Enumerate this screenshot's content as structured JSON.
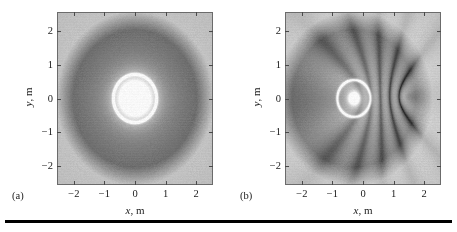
{
  "figure": {
    "background": "#ffffff",
    "rule_color": "#000000"
  },
  "panels": [
    {
      "caption": "(a)",
      "axis": {
        "xlabel_symbol": "x",
        "xlabel_unit": ", m",
        "ylabel_symbol": "y",
        "ylabel_unit": ", m",
        "xticks": [
          "-2",
          "-1",
          "0",
          "1",
          "2"
        ],
        "xtick_values": [
          -2,
          -1,
          0,
          1,
          2
        ],
        "yticks": [
          "2",
          "1",
          "0",
          "-1",
          "-2"
        ],
        "ytick_values": [
          2,
          1,
          0,
          -1,
          -2
        ],
        "xlim": [
          -2.55,
          2.55
        ],
        "ylim": [
          -2.55,
          2.55
        ]
      }
    },
    {
      "caption": "(b)",
      "axis": {
        "xlabel_symbol": "x",
        "xlabel_unit": ", m",
        "ylabel_symbol": "y",
        "ylabel_unit": ", m",
        "xticks": [
          "-2",
          "-1",
          "0",
          "1",
          "2"
        ],
        "xtick_values": [
          -2,
          -1,
          0,
          1,
          2
        ],
        "yticks": [
          "2",
          "1",
          "0",
          "-1",
          "-2"
        ],
        "ytick_values": [
          2,
          1,
          0,
          -1,
          -2
        ],
        "xlim": [
          -2.55,
          2.55
        ],
        "ylim": [
          -2.55,
          2.55
        ]
      }
    }
  ],
  "chart_data": [
    {
      "type": "heatmap",
      "panel": "(a)",
      "title": "",
      "xlabel": "x, m",
      "ylabel": "y, m",
      "xlim": [
        -2.55,
        2.55
      ],
      "ylim": [
        -2.55,
        2.55
      ],
      "grid": false,
      "legend": null,
      "colormap": "grayscale",
      "value_range": [
        0,
        1
      ],
      "description": "Concentric circular interference rings centred at the origin with a broad bright core; ring spacing approximately 0.66 m, fringes fading toward the corners.",
      "field": {
        "model": "radial-wave",
        "wavelength": 0.66,
        "sources": [
          {
            "x": 0.0,
            "y": 0.0,
            "amplitude": 1.0,
            "phase": 0.0
          }
        ],
        "core_radius": 0.42,
        "bright_ring_radius": 0.72,
        "decay": 0.22,
        "corner_fringe_scale": 0.3
      }
    },
    {
      "type": "heatmap",
      "panel": "(b)",
      "title": "",
      "xlabel": "x, m",
      "ylabel": "y, m",
      "xlim": [
        -2.55,
        2.55
      ],
      "ylim": [
        -2.55,
        2.55
      ],
      "grid": false,
      "legend": null,
      "colormap": "grayscale",
      "value_range": [
        0,
        1
      ],
      "description": "Asymmetric distorted interference rings. A small bright spot sits left of centre near (-0.30, 0.0); the contours bulge outward on the right forming a kidney-shaped lobe near (1.5, 0.0), while rings are compressed on the left.",
      "field": {
        "model": "two-source-interference",
        "wavelength": 0.62,
        "sources": [
          {
            "x": -0.3,
            "y": 0.0,
            "amplitude": 1.0,
            "phase": 0.0
          },
          {
            "x": 1.45,
            "y": 0.05,
            "amplitude": 0.55,
            "phase": 3.14159
          }
        ],
        "core_radius": 0.12,
        "bright_ring_radius": 0.55,
        "decay": 0.2,
        "corner_fringe_scale": 0.3
      }
    }
  ]
}
